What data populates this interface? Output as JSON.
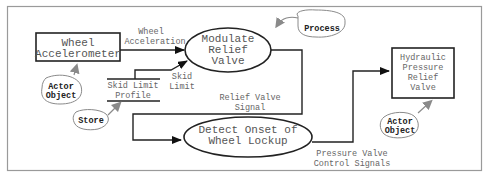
{
  "diagram": {
    "nodes": {
      "wheel_accelerometer": {
        "type": "terminator",
        "lines": [
          "Wheel",
          "Accelerometer"
        ]
      },
      "modulate_relief_valve": {
        "type": "process",
        "lines": [
          "Modulate",
          "Relief",
          "Valve"
        ]
      },
      "detect_onset": {
        "type": "process",
        "lines": [
          "Detect Onset of",
          "Wheel Lockup"
        ]
      },
      "hydraulic_valve": {
        "type": "terminator",
        "lines": [
          "Hydraulic",
          "Pressure",
          "Relief",
          "Valve"
        ]
      },
      "skid_limit_profile": {
        "type": "store",
        "lines": [
          "Skid Limit",
          "Profile"
        ]
      }
    },
    "flows": {
      "wheel_acceleration": {
        "lines": [
          "Wheel",
          "Acceleration"
        ]
      },
      "skid_limit": {
        "lines": [
          "Skid",
          "Limit"
        ]
      },
      "relief_valve_signal": {
        "lines": [
          "Relief Valve",
          "Signal"
        ]
      },
      "pressure_valve_control": {
        "lines": [
          "Pressure Valve",
          "Control Signals"
        ]
      }
    },
    "callouts": {
      "process": "Process",
      "actor_object_left": [
        "Actor",
        "Object"
      ],
      "store": "Store",
      "actor_object_right": [
        "Actor",
        "Object"
      ]
    },
    "colors": {
      "line": "#222222",
      "frame": "#888888",
      "callout_arrow": "#8a8a8a",
      "text": "#555555"
    }
  }
}
